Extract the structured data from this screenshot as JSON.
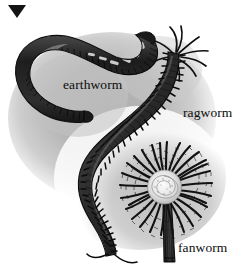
{
  "figure": {
    "media": "grayscale halftone scientific illustration",
    "background_color": "#ffffff",
    "backdrop_color": "#b9b9b9",
    "ink_color": "#141414",
    "marker": {
      "icon": "triangle-down-icon",
      "color": "#141414"
    },
    "labels": {
      "earthworm": "earthworm",
      "ragworm": "ragworm",
      "fanworm": "fanworm"
    },
    "specimens": [
      {
        "name": "earthworm",
        "label": "earthworm",
        "body_form": "smooth segmented hook-shaped body, no appendages",
        "body_color": "#2b2b2b",
        "segments": 46,
        "highlight_color": "#e9e9e9"
      },
      {
        "name": "ragworm",
        "label": "ragworm",
        "body_form": "long S-curved body with paired bristly parapodia and head tentacles",
        "body_color": "#333333",
        "segments": 74,
        "head_tentacles": 9,
        "tail_cirri": 2
      },
      {
        "name": "fanworm",
        "label": "fanworm",
        "body_form": "radial crown of feathery radioles above a striated vertical tube",
        "body_color": "#262626",
        "radioles": 30,
        "crown_center_color": "#efefef",
        "tube_color": "#1f1f1f"
      }
    ]
  }
}
